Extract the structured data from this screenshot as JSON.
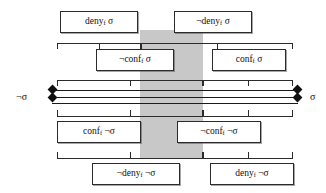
{
  "diagram": {
    "colors": {
      "band": "#c8c8c8",
      "stroke": "#2b2b2b",
      "marker": "#111111",
      "background": "#ffffff"
    },
    "axis": {
      "left_label": "¬σ",
      "right_label": "σ",
      "left_marker": "diamond",
      "right_marker": "diamond",
      "line_count": 3
    },
    "shaded_region": {
      "label": "",
      "x_start_pct": 43,
      "x_end_pct": 62
    },
    "boxes": [
      {
        "id": "deny-sigma",
        "text": "deny",
        "sub": "f",
        "tail": " σ",
        "prefix": "",
        "row": 1,
        "side": "left"
      },
      {
        "id": "not-deny-sigma",
        "text": "deny",
        "sub": "f",
        "tail": " σ",
        "prefix": "¬",
        "row": 1,
        "side": "right"
      },
      {
        "id": "not-conf-sigma",
        "text": "conf",
        "sub": "f",
        "tail": " σ",
        "prefix": "¬",
        "row": 2,
        "side": "left"
      },
      {
        "id": "conf-sigma",
        "text": "conf",
        "sub": "f",
        "tail": " σ",
        "prefix": "",
        "row": 2,
        "side": "right"
      },
      {
        "id": "conf-not-sigma",
        "text": "conf",
        "sub": "f",
        "tail": " ¬σ",
        "prefix": "",
        "row": 3,
        "side": "left"
      },
      {
        "id": "not-conf-not-sigma",
        "text": "conf",
        "sub": "f",
        "tail": " ¬σ",
        "prefix": "¬",
        "row": 3,
        "side": "right"
      },
      {
        "id": "not-deny-not-sigma",
        "text": "deny",
        "sub": "f",
        "tail": " ¬σ",
        "prefix": "¬",
        "row": 4,
        "side": "left"
      },
      {
        "id": "deny-not-sigma",
        "text": "deny",
        "sub": "f",
        "tail": " ¬σ",
        "prefix": "",
        "row": 4,
        "side": "right"
      }
    ],
    "labels": {
      "deny_sigma": "deny_f σ",
      "not_deny_sigma": "¬deny_f σ",
      "not_conf_sigma": "¬conf_f σ",
      "conf_sigma": "conf_f σ",
      "conf_not_sigma": "conf_f ¬σ",
      "not_conf_not_sigma": "¬conf_f ¬σ",
      "not_deny_not_sigma": "¬deny_f ¬σ",
      "deny_not_sigma": "deny_f ¬σ"
    }
  }
}
